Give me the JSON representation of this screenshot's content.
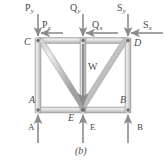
{
  "figure": {
    "caption": "(b)",
    "colors": {
      "member_fill": "#d8d8d8",
      "member_edge": "#9a9a9a",
      "member_highlight": "#f0f0f0",
      "arrow": "#8c8c8c",
      "label_text": "#4a4a4a",
      "background": "#ffffff",
      "joint": "#7a7a7a"
    }
  },
  "applied_loads": [
    {
      "id": "P_y",
      "base": "P",
      "sub": "y",
      "direction": "down",
      "at_joint": "C"
    },
    {
      "id": "P_x",
      "base": "P",
      "sub": "x",
      "direction": "left",
      "at_joint": "C"
    },
    {
      "id": "Q_y",
      "base": "Q",
      "sub": "y",
      "direction": "down",
      "at_joint": "top-middle"
    },
    {
      "id": "Q_x",
      "base": "Q",
      "sub": "x",
      "direction": "left",
      "at_joint": "top-middle"
    },
    {
      "id": "S_y",
      "base": "S",
      "sub": "y",
      "direction": "down",
      "at_joint": "D"
    },
    {
      "id": "S_x",
      "base": "S",
      "sub": "x",
      "direction": "left",
      "at_joint": "D"
    },
    {
      "id": "W",
      "base": "W",
      "sub": "",
      "direction": "down",
      "at_joint": "E"
    }
  ],
  "reactions": [
    {
      "id": "A",
      "base": "A",
      "direction": "up",
      "at_joint": "A"
    },
    {
      "id": "E",
      "base": "E",
      "direction": "up",
      "at_joint": "E"
    },
    {
      "id": "B",
      "base": "B",
      "direction": "up",
      "at_joint": "B"
    }
  ],
  "joints": [
    {
      "id": "C",
      "label": "C",
      "x": 38,
      "y": 41
    },
    {
      "id": "D",
      "label": "D",
      "x": 128,
      "y": 41
    },
    {
      "id": "A",
      "label": "A",
      "x": 38,
      "y": 110
    },
    {
      "id": "B",
      "label": "B",
      "x": 128,
      "y": 110
    },
    {
      "id": "E",
      "label": "E",
      "x": 83,
      "y": 110
    }
  ],
  "labels": {
    "Py": "P",
    "Py_sub": "y",
    "Px": "P",
    "Px_sub": "x",
    "Qy": "Q",
    "Qy_sub": "y",
    "Qx": "Q",
    "Qx_sub": "x",
    "Sy": "S",
    "Sy_sub": "y",
    "Sx": "S",
    "Sx_sub": "x",
    "W": "W",
    "joint_C": "C",
    "joint_D": "D",
    "joint_A": "A",
    "joint_B": "B",
    "joint_E": "E",
    "reaction_A": "A",
    "reaction_E": "E",
    "reaction_B": "B",
    "caption": "(b)"
  }
}
